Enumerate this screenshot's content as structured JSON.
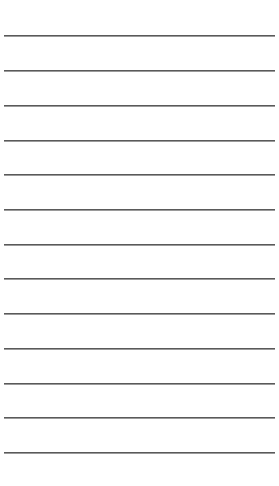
{
  "paper": {
    "background": "#ffffff",
    "line_color": "#5a5a5a",
    "line_count": 13,
    "line_positions_y": [
      36,
      71,
      106,
      141,
      175,
      210,
      245,
      279,
      314,
      349,
      384,
      418,
      453
    ]
  }
}
